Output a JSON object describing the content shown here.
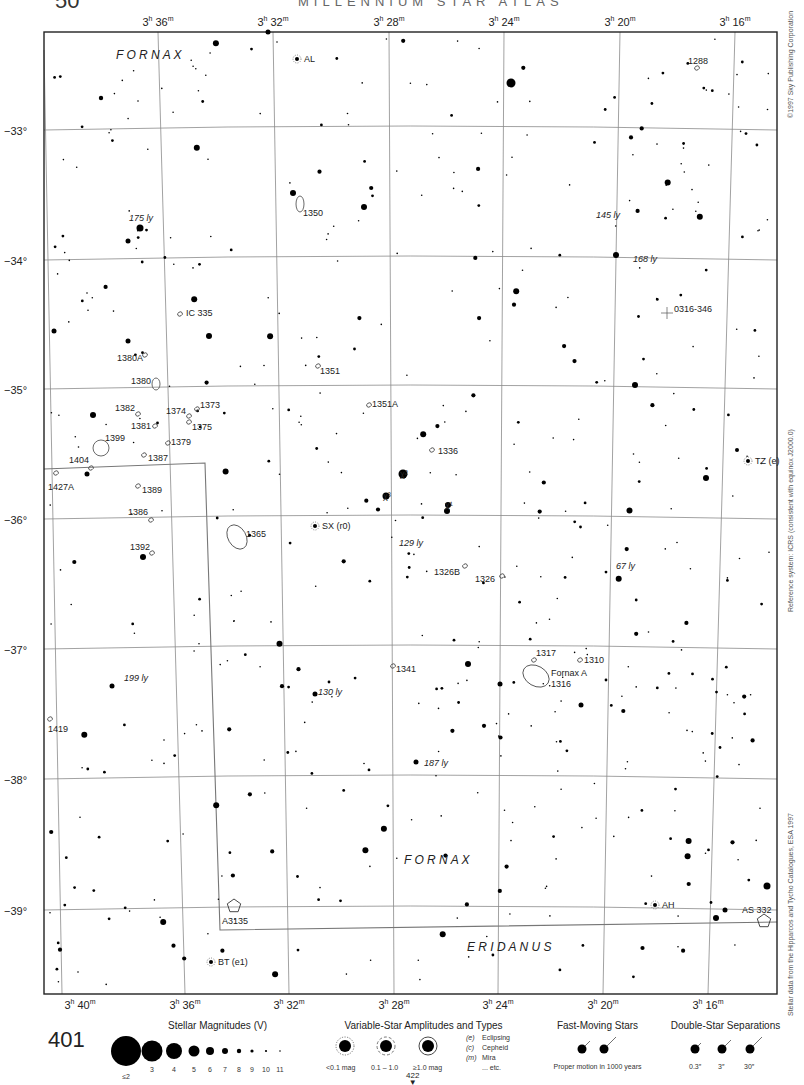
{
  "header": {
    "page_number_top": "50",
    "running_head": "MILLENNIUM STAR ATLAS"
  },
  "chart": {
    "ra_labels_top": [
      {
        "h": "3",
        "m": "36",
        "x": 158
      },
      {
        "h": "3",
        "m": "32",
        "x": 273
      },
      {
        "h": "3",
        "m": "28",
        "x": 389
      },
      {
        "h": "3",
        "m": "24",
        "x": 504
      },
      {
        "h": "3",
        "m": "20",
        "x": 620
      },
      {
        "h": "3",
        "m": "16",
        "x": 735
      }
    ],
    "ra_labels_bottom": [
      {
        "h": "3",
        "m": "40",
        "x": 80
      },
      {
        "h": "3",
        "m": "36",
        "x": 185
      },
      {
        "h": "3",
        "m": "32",
        "x": 289
      },
      {
        "h": "3",
        "m": "28",
        "x": 394
      },
      {
        "h": "3",
        "m": "24",
        "x": 498
      },
      {
        "h": "3",
        "m": "20",
        "x": 603
      },
      {
        "h": "3",
        "m": "16",
        "x": 708
      }
    ],
    "dec_labels": [
      {
        "label": "−33°",
        "y": 132
      },
      {
        "label": "−34°",
        "y": 262
      },
      {
        "label": "−35°",
        "y": 391
      },
      {
        "label": "−36°",
        "y": 521
      },
      {
        "label": "−37°",
        "y": 651
      },
      {
        "label": "−38°",
        "y": 781
      },
      {
        "label": "−39°",
        "y": 912
      }
    ],
    "constellations": [
      {
        "name": "F O R N A X",
        "x": 116,
        "y": 59
      },
      {
        "name": "F O R N A X",
        "x": 404,
        "y": 864
      },
      {
        "name": "E R I D A N U S",
        "x": 467,
        "y": 951
      }
    ],
    "galaxies": [
      {
        "label": "1288",
        "x": 697,
        "y": 68,
        "lx": 688,
        "ly": 64
      },
      {
        "label": "1350",
        "x": 300,
        "y": 204,
        "lx": 303,
        "ly": 216
      },
      {
        "label": "IC 335",
        "x": 180,
        "y": 314,
        "lx": 186,
        "ly": 316
      },
      {
        "label": "1380A",
        "x": 145,
        "y": 355,
        "lx": 117,
        "ly": 361
      },
      {
        "label": "1351",
        "x": 318,
        "y": 366,
        "lx": 320,
        "ly": 374
      },
      {
        "label": "1380",
        "x": 156,
        "y": 384,
        "lx": 131,
        "ly": 384
      },
      {
        "label": "1351A",
        "x": 369,
        "y": 405,
        "lx": 372,
        "ly": 407
      },
      {
        "label": "1382",
        "x": 138,
        "y": 414,
        "lx": 115,
        "ly": 411
      },
      {
        "label": "1374",
        "x": 189,
        "y": 416,
        "lx": 166,
        "ly": 414
      },
      {
        "label": "1373",
        "x": 197,
        "y": 409,
        "lx": 200,
        "ly": 408
      },
      {
        "label": "1375",
        "x": 189,
        "y": 422,
        "lx": 192,
        "ly": 430
      },
      {
        "label": "1381",
        "x": 155,
        "y": 426,
        "lx": 131,
        "ly": 429
      },
      {
        "label": "1399",
        "x": 101,
        "y": 448,
        "lx": 105,
        "ly": 441
      },
      {
        "label": "1379",
        "x": 168,
        "y": 443,
        "lx": 171,
        "ly": 445
      },
      {
        "label": "1387",
        "x": 144,
        "y": 455,
        "lx": 148,
        "ly": 461
      },
      {
        "label": "1336",
        "x": 432,
        "y": 450,
        "lx": 438,
        "ly": 454
      },
      {
        "label": "1404",
        "x": 91,
        "y": 468,
        "lx": 69,
        "ly": 463
      },
      {
        "label": "1427A",
        "x": 56,
        "y": 473,
        "lx": 48,
        "ly": 490
      },
      {
        "label": "1389",
        "x": 138,
        "y": 486,
        "lx": 142,
        "ly": 493
      },
      {
        "label": "1386",
        "x": 151,
        "y": 520,
        "lx": 128,
        "ly": 515
      },
      {
        "label": "1365",
        "x": 237,
        "y": 537,
        "lx": 246,
        "ly": 537
      },
      {
        "label": "1392",
        "x": 152,
        "y": 553,
        "lx": 130,
        "ly": 550
      },
      {
        "label": "1326B",
        "x": 465,
        "y": 566,
        "lx": 434,
        "ly": 575
      },
      {
        "label": "1326",
        "x": 502,
        "y": 576,
        "lx": 475,
        "ly": 582
      },
      {
        "label": "1317",
        "x": 534,
        "y": 660,
        "lx": 536,
        "ly": 656
      },
      {
        "label": "1310",
        "x": 580,
        "y": 660,
        "lx": 584,
        "ly": 663
      },
      {
        "label": "Fornax A",
        "x": 536,
        "y": 676,
        "lx": 551,
        "ly": 676
      },
      {
        "label": "1316",
        "x": 536,
        "y": 676,
        "lx": 551,
        "ly": 687
      },
      {
        "label": "1341",
        "x": 393,
        "y": 666,
        "lx": 396,
        "ly": 672
      },
      {
        "label": "1419",
        "x": 50,
        "y": 719,
        "lx": 48,
        "ly": 732
      }
    ],
    "stars_named": [
      {
        "label": "AL",
        "kind": "variable",
        "x": 307,
        "y": 59
      },
      {
        "label": "χ²",
        "x": 403,
        "y": 474
      },
      {
        "label": "χ³",
        "x": 386,
        "y": 496
      },
      {
        "label": "χ¹",
        "x": 448,
        "y": 505
      },
      {
        "label": "SX (r0)",
        "kind": "variable",
        "x": 325,
        "y": 526
      },
      {
        "label": "TZ (e)",
        "kind": "variable",
        "x": 758,
        "y": 461
      },
      {
        "label": "AH",
        "kind": "variable",
        "x": 665,
        "y": 905
      },
      {
        "label": "BT (e1)",
        "kind": "variable",
        "x": 221,
        "y": 962
      }
    ],
    "distances": [
      {
        "label": "175 ly",
        "x": 129,
        "y": 221
      },
      {
        "label": "145 ly",
        "x": 596,
        "y": 218
      },
      {
        "label": "168 ly",
        "x": 633,
        "y": 262
      },
      {
        "label": "129 ly",
        "x": 399,
        "y": 546
      },
      {
        "label": "67 ly",
        "x": 616,
        "y": 569
      },
      {
        "label": "199 ly",
        "x": 124,
        "y": 681
      },
      {
        "label": "130 ly",
        "x": 318,
        "y": 695
      },
      {
        "label": "187 ly",
        "x": 424,
        "y": 766
      }
    ],
    "clusters": [
      {
        "label": "A3135",
        "x": 234,
        "y": 911
      },
      {
        "label": "AS 332",
        "x": 765,
        "y": 921
      }
    ],
    "cross_marker": {
      "label": "0316-346",
      "x": 667,
      "y": 313
    }
  },
  "side_texts": {
    "copyright": "©1997 Sky Publishing Corporation",
    "reference": "Reference system: ICRS (consistent with equinox J2000.0)",
    "data_source": "Stellar data from the Hipparcos and Tycho Catalogues, ESA 1997"
  },
  "legend": {
    "page_number": "401",
    "next_page": "422",
    "magnitudes": {
      "title": "Stellar Magnitudes (V)",
      "items": [
        {
          "label": "≤2",
          "r": 15
        },
        {
          "label": "3",
          "r": 10.5
        },
        {
          "label": "4",
          "r": 8
        },
        {
          "label": "5",
          "r": 5.5
        },
        {
          "label": "6",
          "r": 4
        },
        {
          "label": "7",
          "r": 3
        },
        {
          "label": "8",
          "r": 2.2
        },
        {
          "label": "9",
          "r": 1.6
        },
        {
          "label": "10",
          "r": 1.1
        },
        {
          "label": "11",
          "r": 0.8
        }
      ]
    },
    "variables": {
      "title": "Variable-Star Amplitudes and Types",
      "amplitudes": [
        "<0.1 mag",
        "0.1 – 1.0",
        "≥1.0 mag"
      ],
      "types": [
        {
          "code": "(e)",
          "name": "Eclipsing"
        },
        {
          "code": "(c)",
          "name": "Cepheid"
        },
        {
          "code": "(m)",
          "name": "Mira"
        },
        {
          "code": "",
          "name": "... etc."
        }
      ]
    },
    "fast_moving": {
      "title": "Fast-Moving Stars",
      "caption": "Proper motion in 1000 years"
    },
    "double_stars": {
      "title": "Double-Star Separations",
      "items": [
        "0.3″",
        "3″",
        "30″"
      ]
    }
  }
}
